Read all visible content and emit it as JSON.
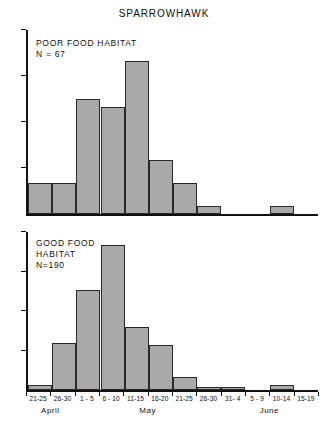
{
  "chart_data": {
    "type": "bar",
    "title": "SPARROWHAWK",
    "xlabel": "",
    "ylabel": "",
    "grid": false,
    "legend": "none",
    "categories": [
      "21-25",
      "26-30",
      "1 - 5",
      "6 - 10",
      "11-15",
      "16-20",
      "21-25",
      "26-30",
      "31- 4",
      "5 - 9",
      "10-14",
      "15-19"
    ],
    "month_groups": [
      {
        "name": "April",
        "start_index": 0,
        "end_index": 1
      },
      {
        "name": "May",
        "start_index": 2,
        "end_index": 7
      },
      {
        "name": "June",
        "start_index": 8,
        "end_index": 11
      }
    ],
    "panels": [
      {
        "id": "poor",
        "label": "POOR FOOD HABITAT",
        "n_label": "N = 67",
        "n": 67,
        "ylim": [
          0,
          24
        ],
        "yticks": [
          0,
          6,
          12,
          18,
          24
        ],
        "values": [
          4,
          4,
          15,
          14,
          20,
          7,
          4,
          1,
          0,
          0,
          1,
          0
        ]
      },
      {
        "id": "good",
        "label": "GOOD FOOD\nHABITAT",
        "n_label": "N=190",
        "n": 190,
        "ylim": [
          0,
          60
        ],
        "yticks": [
          0,
          15,
          30,
          45,
          60
        ],
        "values": [
          2,
          18,
          38,
          55,
          24,
          17,
          5,
          1,
          1,
          0,
          2,
          0
        ]
      }
    ],
    "colors": {
      "bar_fill": "#a9a9a9",
      "bar_edge": "#2a2a2a",
      "axis": "#111111",
      "text": "#111111",
      "background": "#ffffff"
    }
  }
}
